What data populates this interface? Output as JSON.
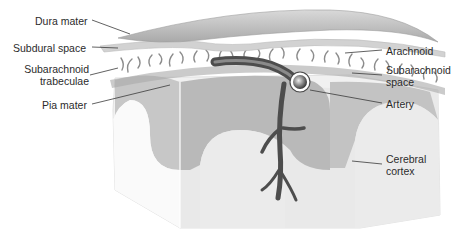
{
  "diagram": {
    "colors": {
      "background": "#ffffff",
      "dura": "#bdbdbd",
      "arachnoid": "#d2d2d2",
      "trabeculae": "#8a8a8a",
      "grey_matter": "#b5b5b5",
      "white_matter": "#e6e6e6",
      "block_side": "#f4f4f4",
      "vessel": "#5a5a5a",
      "leader": "#3a3a3a",
      "text": "#2b2b2b"
    },
    "labels_left": [
      {
        "id": "dura-mater",
        "text": "Dura mater"
      },
      {
        "id": "subdural-space",
        "text": "Subdural space"
      },
      {
        "id": "subarachnoid-trabeculae",
        "text": "Subarachnoid\ntrabeculae",
        "line1": "Subarachnoid",
        "line2": "trabeculae"
      },
      {
        "id": "pia-mater",
        "text": "Pia mater"
      }
    ],
    "labels_right": [
      {
        "id": "arachnoid",
        "text": "Arachnoid"
      },
      {
        "id": "subarachnoid-space",
        "text": "Subarachnoid\nspace",
        "line1": "Subarachnoid",
        "line2": "space"
      },
      {
        "id": "artery",
        "text": "Artery"
      },
      {
        "id": "cerebral-cortex",
        "text": "Cerebral\ncortex",
        "line1": "Cerebral",
        "line2": "cortex"
      }
    ]
  }
}
